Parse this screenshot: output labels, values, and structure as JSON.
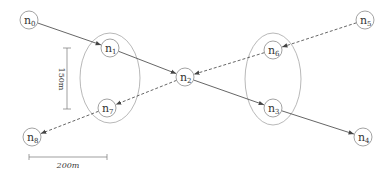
{
  "diagram": {
    "nodes": [
      {
        "id": "n0",
        "base": "n",
        "sub": "0",
        "x": 29,
        "y": 20
      },
      {
        "id": "n1",
        "base": "n",
        "sub": "1",
        "x": 110,
        "y": 48
      },
      {
        "id": "n2",
        "base": "n",
        "sub": "2",
        "x": 185,
        "y": 77
      },
      {
        "id": "n3",
        "base": "n",
        "sub": "3",
        "x": 273,
        "y": 108
      },
      {
        "id": "n4",
        "base": "n",
        "sub": "4",
        "x": 363,
        "y": 137
      },
      {
        "id": "n5",
        "base": "n",
        "sub": "5",
        "x": 365,
        "y": 20
      },
      {
        "id": "n6",
        "base": "n",
        "sub": "6",
        "x": 273,
        "y": 50
      },
      {
        "id": "n7",
        "base": "n",
        "sub": "7",
        "x": 107,
        "y": 108
      },
      {
        "id": "n8",
        "base": "n",
        "sub": "8",
        "x": 32,
        "y": 137
      }
    ],
    "edges": [
      {
        "from": "n0",
        "to": "n1",
        "style": "solid"
      },
      {
        "from": "n1",
        "to": "n2",
        "style": "solid"
      },
      {
        "from": "n2",
        "to": "n3",
        "style": "solid"
      },
      {
        "from": "n3",
        "to": "n4",
        "style": "solid"
      },
      {
        "from": "n5",
        "to": "n6",
        "style": "dashed"
      },
      {
        "from": "n6",
        "to": "n2",
        "style": "dashed"
      },
      {
        "from": "n2",
        "to": "n7",
        "style": "dashed"
      },
      {
        "from": "n7",
        "to": "n8",
        "style": "dashed"
      }
    ],
    "groups": [
      {
        "name": "left-cluster",
        "cx": 110,
        "cy": 78,
        "rx": 30,
        "ry": 45,
        "members": [
          "n1",
          "n7"
        ]
      },
      {
        "name": "right-cluster",
        "cx": 273,
        "cy": 79,
        "rx": 28,
        "ry": 46,
        "members": [
          "n6",
          "n3"
        ]
      }
    ],
    "scale": {
      "vertical_label": "150m",
      "horizontal_label": "200m"
    }
  }
}
